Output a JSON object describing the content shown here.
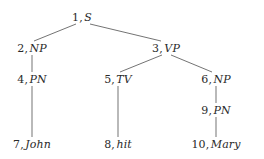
{
  "figure": {
    "kind": "syntax-parse-tree",
    "sentence": "John hit Mary",
    "background_color": "#ffffff",
    "text_color": "#2a2a2a",
    "edge_color": "#5a5a5a",
    "separator": ","
  },
  "nodes": [
    {
      "id": "1",
      "index": "1",
      "label": "S",
      "x": 82,
      "y": 17,
      "level": 0
    },
    {
      "id": "2",
      "index": "2",
      "label": "NP",
      "x": 32,
      "y": 48,
      "level": 1
    },
    {
      "id": "3",
      "index": "3",
      "label": "VP",
      "x": 166,
      "y": 48,
      "level": 1
    },
    {
      "id": "4",
      "index": "4",
      "label": "PN",
      "x": 32,
      "y": 79,
      "level": 2
    },
    {
      "id": "5",
      "index": "5",
      "label": "TV",
      "x": 118,
      "y": 79,
      "level": 2
    },
    {
      "id": "6",
      "index": "6",
      "label": "NP",
      "x": 216,
      "y": 79,
      "level": 2
    },
    {
      "id": "9",
      "index": "9",
      "label": "PN",
      "x": 216,
      "y": 110,
      "level": 3
    },
    {
      "id": "7",
      "index": "7",
      "label": "John",
      "x": 32,
      "y": 144,
      "level": 4
    },
    {
      "id": "8",
      "index": "8",
      "label": "hit",
      "x": 118,
      "y": 144,
      "level": 4
    },
    {
      "id": "10",
      "index": "10",
      "label": "Mary",
      "x": 216,
      "y": 144,
      "level": 4
    }
  ],
  "edges": [
    {
      "from": "1",
      "to": "2",
      "x1": 76,
      "y1": 24,
      "x2": 34,
      "y2": 41
    },
    {
      "from": "1",
      "to": "3",
      "x1": 90,
      "y1": 24,
      "x2": 161,
      "y2": 41
    },
    {
      "from": "2",
      "to": "4",
      "x1": 32,
      "y1": 55,
      "x2": 32,
      "y2": 72
    },
    {
      "from": "3",
      "to": "5",
      "x1": 162,
      "y1": 55,
      "x2": 120,
      "y2": 72
    },
    {
      "from": "3",
      "to": "6",
      "x1": 171,
      "y1": 55,
      "x2": 212,
      "y2": 72
    },
    {
      "from": "4",
      "to": "7",
      "x1": 32,
      "y1": 86,
      "x2": 32,
      "y2": 137
    },
    {
      "from": "5",
      "to": "8",
      "x1": 118,
      "y1": 86,
      "x2": 118,
      "y2": 137
    },
    {
      "from": "6",
      "to": "9",
      "x1": 216,
      "y1": 86,
      "x2": 216,
      "y2": 103
    },
    {
      "from": "9",
      "to": "10",
      "x1": 216,
      "y1": 117,
      "x2": 216,
      "y2": 137
    }
  ]
}
